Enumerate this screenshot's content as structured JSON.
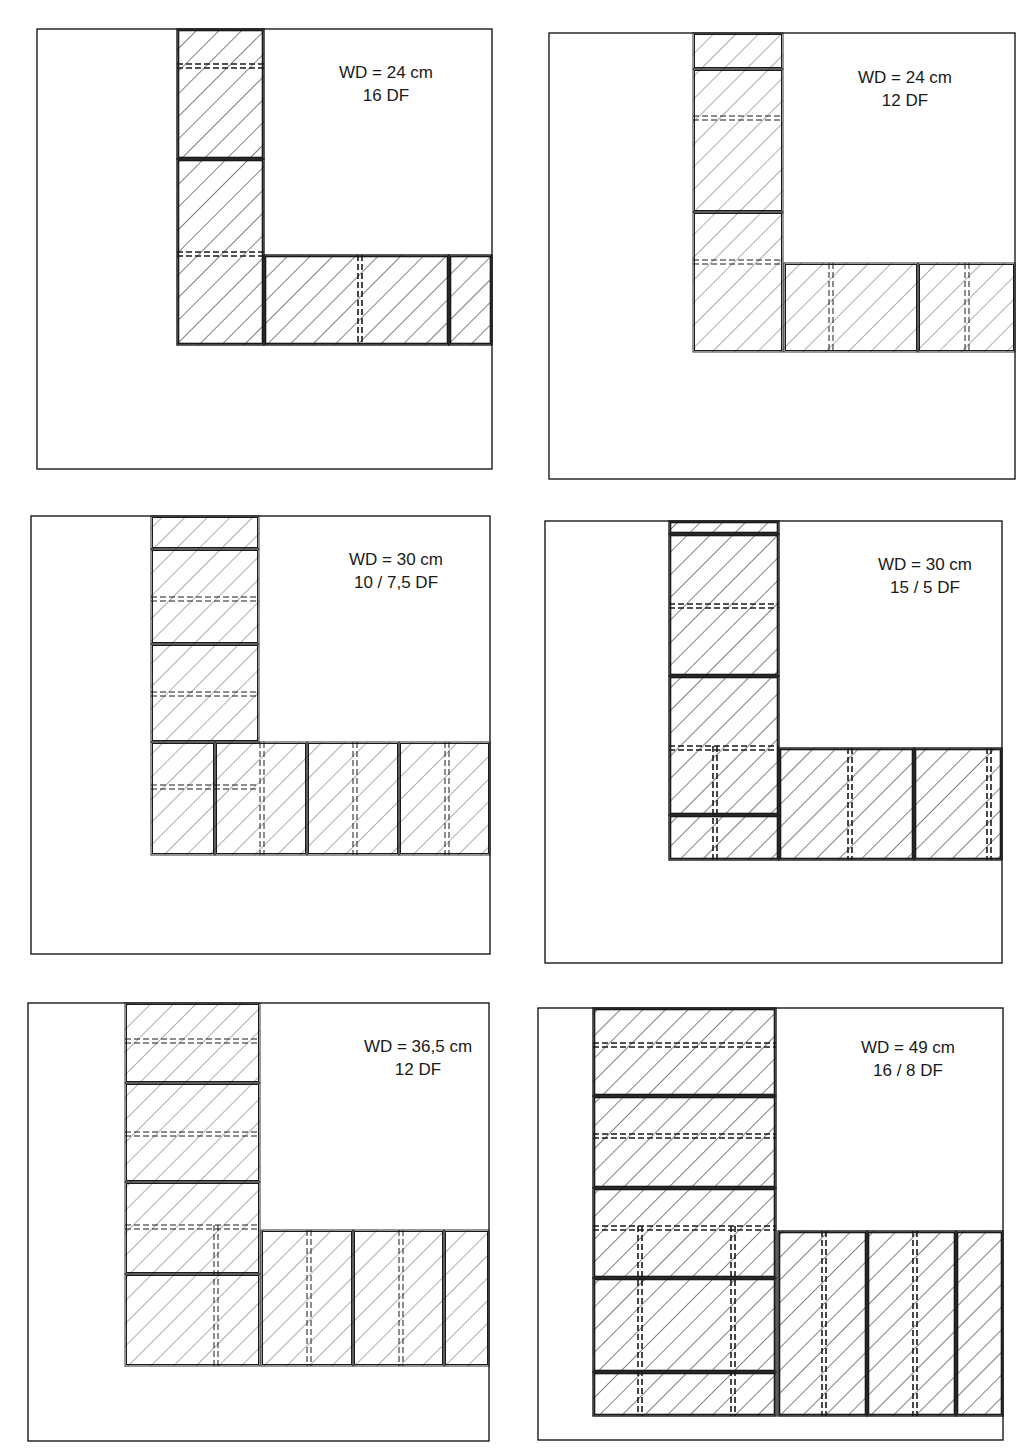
{
  "figure": {
    "ink_color": "#1a1a1a",
    "background": "#ffffff",
    "panels": [
      {
        "id": "wd24-16df",
        "wall_thickness_label": "WD = 24 cm",
        "format_label": "16 DF",
        "line_weight": "heavy"
      },
      {
        "id": "wd24-12df",
        "wall_thickness_label": "WD = 24 cm",
        "format_label": "12 DF",
        "line_weight": "light"
      },
      {
        "id": "wd30-10-7.5df",
        "wall_thickness_label": "WD = 30 cm",
        "format_label": "10 / 7,5 DF",
        "line_weight": "light"
      },
      {
        "id": "wd30-15-5df",
        "wall_thickness_label": "WD = 30 cm",
        "format_label": "15 / 5 DF",
        "line_weight": "heavy"
      },
      {
        "id": "wd36.5-12df",
        "wall_thickness_label": "WD = 36,5 cm",
        "format_label": "12 DF",
        "line_weight": "light"
      },
      {
        "id": "wd49-16-8df",
        "wall_thickness_label": "WD = 49 cm",
        "format_label": "16 / 8 DF",
        "line_weight": "heavy"
      }
    ]
  }
}
